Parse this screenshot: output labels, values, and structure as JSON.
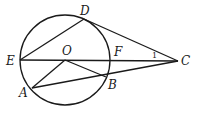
{
  "diagram": {
    "type": "geometry",
    "circle": {
      "center": "O",
      "cx": 65,
      "cy": 60,
      "r": 45
    },
    "points": {
      "E": {
        "label": "E",
        "x": 20,
        "y": 60
      },
      "O": {
        "label": "O",
        "x": 65,
        "y": 60
      },
      "F": {
        "label": "F",
        "x": 110,
        "y": 60
      },
      "C": {
        "label": "C",
        "x": 178,
        "y": 61
      },
      "D": {
        "label": "D",
        "x": 84,
        "y": 19
      },
      "B": {
        "label": "B",
        "x": 106,
        "y": 77
      },
      "A": {
        "label": "A",
        "x": 32,
        "y": 88
      }
    },
    "segments": [
      "EC",
      "ED",
      "DC",
      "AC",
      "OA",
      "OB"
    ],
    "angle_label": {
      "text": "1",
      "vertex": "C",
      "between": [
        "DC",
        "EC"
      ]
    }
  }
}
